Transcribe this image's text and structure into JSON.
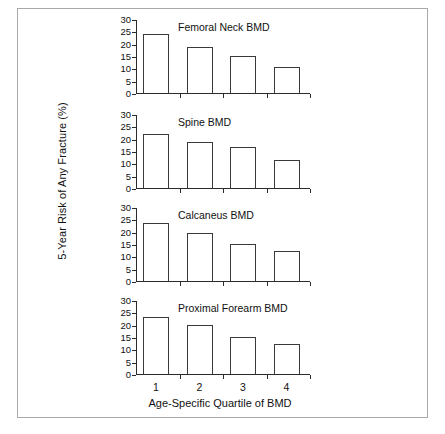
{
  "chart_data": {
    "type": "bar",
    "title": "",
    "xlabel": "Age-Specific Quartile of BMD",
    "ylabel": "5-Year Risk of Any Fracture (%)",
    "categories": [
      "1",
      "2",
      "3",
      "4"
    ],
    "ylim": [
      0,
      30
    ],
    "yticks": [
      0,
      5,
      10,
      15,
      20,
      25,
      30
    ],
    "ytick_labels": [
      "0",
      "5",
      "10",
      "15",
      "20",
      "25",
      "30"
    ],
    "grid": false,
    "legend": "none",
    "panels": [
      {
        "title": "Femoral Neck BMD",
        "values": [
          24.0,
          18.5,
          15.0,
          10.5
        ]
      },
      {
        "title": "Spine BMD",
        "values": [
          22.0,
          18.5,
          16.5,
          11.5
        ]
      },
      {
        "title": "Calcaneus BMD",
        "values": [
          23.5,
          19.5,
          15.0,
          12.0
        ]
      },
      {
        "title": "Proximal Forearm BMD",
        "values": [
          23.0,
          20.0,
          15.0,
          12.0
        ]
      }
    ],
    "series": [
      {
        "name": "Femoral Neck BMD",
        "values": [
          24.0,
          18.5,
          15.0,
          10.5
        ]
      },
      {
        "name": "Spine BMD",
        "values": [
          22.0,
          18.5,
          16.5,
          11.5
        ]
      },
      {
        "name": "Calcaneus BMD",
        "values": [
          23.5,
          19.5,
          15.0,
          12.0
        ]
      },
      {
        "name": "Proximal Forearm BMD",
        "values": [
          23.0,
          20.0,
          15.0,
          12.0
        ]
      }
    ],
    "colors": {
      "bar_fill": "#ffffff",
      "bar_edge": "#3a3a3a",
      "axis": "#2b2b2b",
      "frame": "#a9a9a9",
      "text": "#111111",
      "background": "#ffffff"
    }
  }
}
